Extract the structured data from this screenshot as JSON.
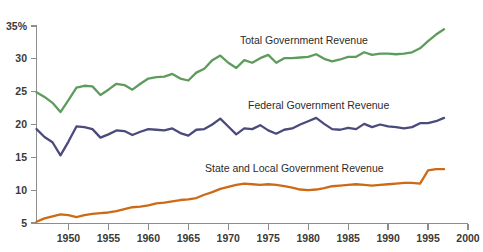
{
  "figure": {
    "background_color": "#ffffff",
    "axis_color": "#8d8d8d",
    "cropped_title_fragment": "",
    "y_axis_top_label": "35%"
  },
  "labels": {
    "total": "Total Government Revenue",
    "federal": "Federal Government Revenue",
    "state_local": "State and Local Government Revenue"
  },
  "chart_data": {
    "type": "line",
    "title": "",
    "subtitle": "",
    "xlabel": "",
    "ylabel": "",
    "xlim": [
      1946,
      2000
    ],
    "ylim": [
      5,
      35
    ],
    "grid": false,
    "legend": "inline-labels",
    "x_tick_labels": [
      "1950",
      "1955",
      "1960",
      "1965",
      "1970",
      "1975",
      "1980",
      "1985",
      "1990",
      "1995",
      "2000"
    ],
    "x_ticks": [
      1950,
      1955,
      1960,
      1965,
      1970,
      1975,
      1980,
      1985,
      1990,
      1995,
      2000
    ],
    "y_tick_labels": [
      "35%",
      "30",
      "25",
      "20",
      "15",
      "10",
      "5"
    ],
    "y_ticks": [
      35,
      30,
      25,
      20,
      15,
      10,
      5
    ],
    "x": [
      1946,
      1947,
      1948,
      1949,
      1950,
      1951,
      1952,
      1953,
      1954,
      1955,
      1956,
      1957,
      1958,
      1959,
      1960,
      1961,
      1962,
      1963,
      1964,
      1965,
      1966,
      1967,
      1968,
      1969,
      1970,
      1971,
      1972,
      1973,
      1974,
      1975,
      1976,
      1977,
      1978,
      1979,
      1980,
      1981,
      1982,
      1983,
      1984,
      1985,
      1986,
      1987,
      1988,
      1989,
      1990,
      1991,
      1992,
      1993,
      1994,
      1995,
      1996,
      1997
    ],
    "series": [
      {
        "name": "Total Government Revenue",
        "color": "#5d9c5d",
        "values": [
          24.9,
          24.2,
          23.3,
          21.9,
          23.7,
          25.6,
          25.9,
          25.8,
          24.5,
          25.3,
          26.2,
          26.0,
          25.3,
          26.2,
          27.0,
          27.2,
          27.3,
          27.7,
          27.0,
          26.7,
          27.9,
          28.5,
          29.8,
          30.5,
          29.4,
          28.6,
          29.8,
          29.4,
          30.1,
          30.6,
          29.4,
          30.1,
          30.1,
          30.2,
          30.3,
          30.7,
          30.0,
          29.6,
          29.9,
          30.3,
          30.3,
          31.0,
          30.6,
          30.8,
          30.8,
          30.7,
          30.8,
          31.0,
          31.6,
          32.7,
          33.7,
          34.5
        ]
      },
      {
        "name": "Federal Government Revenue",
        "color": "#4a4a7d",
        "values": [
          19.3,
          18.1,
          17.3,
          15.3,
          17.4,
          19.7,
          19.6,
          19.3,
          18.0,
          18.5,
          19.1,
          19.0,
          18.4,
          18.9,
          19.3,
          19.2,
          19.1,
          19.4,
          18.7,
          18.3,
          19.2,
          19.3,
          20.0,
          20.9,
          19.7,
          18.5,
          19.4,
          19.3,
          19.9,
          19.1,
          18.6,
          19.2,
          19.4,
          20.0,
          20.5,
          21.0,
          20.1,
          19.3,
          19.2,
          19.5,
          19.3,
          20.1,
          19.6,
          20.0,
          19.7,
          19.6,
          19.4,
          19.6,
          20.2,
          20.2,
          20.5,
          21.0
        ]
      },
      {
        "name": "State and Local Government Revenue",
        "color": "#cc6a16",
        "values": [
          5.2,
          5.7,
          6.0,
          6.3,
          6.2,
          5.9,
          6.2,
          6.4,
          6.5,
          6.6,
          6.8,
          7.1,
          7.4,
          7.5,
          7.7,
          8.0,
          8.1,
          8.3,
          8.5,
          8.6,
          8.8,
          9.3,
          9.7,
          10.2,
          10.5,
          10.8,
          11.0,
          10.9,
          10.8,
          10.9,
          10.8,
          10.6,
          10.4,
          10.1,
          10.0,
          10.1,
          10.3,
          10.6,
          10.7,
          10.8,
          10.9,
          10.8,
          10.7,
          10.8,
          10.9,
          11.0,
          11.1,
          11.1,
          11.0,
          13.0,
          13.2,
          13.2
        ]
      }
    ]
  }
}
